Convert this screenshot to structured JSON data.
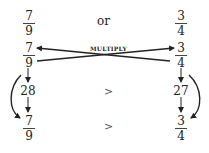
{
  "title_row": {
    "left": {
      "numerator": "7",
      "denominator": "9"
    },
    "connector": "or",
    "right": {
      "numerator": "3",
      "denominator": "4"
    }
  },
  "multiply_row": {
    "left": {
      "numerator": "7",
      "denominator": "9"
    },
    "label": "MULTIPLY",
    "right": {
      "numerator": "3",
      "denominator": "4"
    }
  },
  "products_row": {
    "left": "28",
    "comparison": ">",
    "right": "27"
  },
  "result_row": {
    "left": {
      "numerator": "7",
      "denominator": "9"
    },
    "comparison": ">",
    "right": {
      "numerator": "3",
      "denominator": "4"
    }
  },
  "colors": {
    "ink": "#222222",
    "background": "#ffffff"
  }
}
